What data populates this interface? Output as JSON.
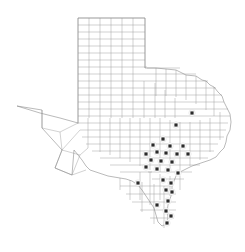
{
  "figure": {
    "kind": "distribution-map",
    "region_label": "Texas",
    "background_color": "#ffffff",
    "boundary_color": "#9a9a9a",
    "outline_color": "#8c8c8c",
    "dot_color": "#2b2b2b",
    "dot_halo_color": "#ffffff",
    "dot_radius_px": 1.6,
    "halo_radius_px": 3.2,
    "width_px": 245,
    "height_px": 252
  },
  "chart_data": {
    "type": "map",
    "title": "",
    "subtitle": "",
    "xlabel": "",
    "ylabel": "",
    "legend": [],
    "annotations": [],
    "grid": false,
    "marker_count": 28,
    "marker_description": "filled square markers indicating recorded county occurrences",
    "markers": [
      {
        "x": 192,
        "y": 113
      },
      {
        "x": 176,
        "y": 125
      },
      {
        "x": 163,
        "y": 139
      },
      {
        "x": 153,
        "y": 145
      },
      {
        "x": 170,
        "y": 146
      },
      {
        "x": 183,
        "y": 146
      },
      {
        "x": 146,
        "y": 154
      },
      {
        "x": 157,
        "y": 152
      },
      {
        "x": 166,
        "y": 153
      },
      {
        "x": 177,
        "y": 154
      },
      {
        "x": 188,
        "y": 154
      },
      {
        "x": 151,
        "y": 160
      },
      {
        "x": 161,
        "y": 161
      },
      {
        "x": 172,
        "y": 162
      },
      {
        "x": 146,
        "y": 167
      },
      {
        "x": 157,
        "y": 169
      },
      {
        "x": 168,
        "y": 170
      },
      {
        "x": 178,
        "y": 173
      },
      {
        "x": 138,
        "y": 183
      },
      {
        "x": 163,
        "y": 180
      },
      {
        "x": 171,
        "y": 183
      },
      {
        "x": 166,
        "y": 190
      },
      {
        "x": 172,
        "y": 192
      },
      {
        "x": 157,
        "y": 205
      },
      {
        "x": 168,
        "y": 201
      },
      {
        "x": 166,
        "y": 211
      },
      {
        "x": 171,
        "y": 216
      },
      {
        "x": 167,
        "y": 223
      }
    ],
    "axis_ranges": {
      "x": [
        0,
        245
      ],
      "y": [
        0,
        252
      ]
    }
  }
}
